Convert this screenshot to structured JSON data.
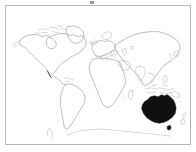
{
  "figure": {
    "type": "world-map-outline",
    "title": "",
    "caption": "",
    "background_color": "#ffffff",
    "frame_color": "#b6b6b6",
    "coastline_color": "#8a8a8a",
    "highlight_color": "#101010",
    "highlighted_region": "Australia"
  },
  "map_data": {
    "projection": "equirectangular",
    "lon_range": [
      -180,
      180
    ],
    "lat_range": [
      -90,
      90
    ],
    "regions": [
      {
        "name": "North America",
        "filled": false,
        "label": ""
      },
      {
        "name": "Greenland",
        "filled": false,
        "label": ""
      },
      {
        "name": "South America",
        "filled": false,
        "label": ""
      },
      {
        "name": "Europe",
        "filled": false,
        "label": ""
      },
      {
        "name": "Africa",
        "filled": false,
        "label": ""
      },
      {
        "name": "Asia",
        "filled": false,
        "label": ""
      },
      {
        "name": "Southeast Asia / Indonesia",
        "filled": false,
        "label": ""
      },
      {
        "name": "Australia",
        "filled": true,
        "label": ""
      },
      {
        "name": "New Zealand",
        "filled": false,
        "label": ""
      },
      {
        "name": "Antarctica",
        "filled": false,
        "label": ""
      },
      {
        "name": "Antarctic Peninsula",
        "filled": false,
        "label": ""
      },
      {
        "name": "Japan",
        "filled": false,
        "label": ""
      },
      {
        "name": "Madagascar",
        "filled": false,
        "label": ""
      },
      {
        "name": "British Isles",
        "filled": false,
        "label": ""
      }
    ],
    "legend": {
      "visible": false,
      "entries": []
    },
    "graticule": {
      "visible": false
    },
    "scale_bar": {
      "visible": false
    },
    "compass": {
      "visible": false
    }
  },
  "marks": {
    "top_tick_visible": true
  }
}
